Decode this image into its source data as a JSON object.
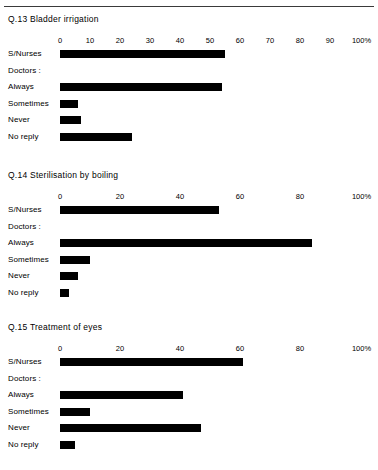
{
  "page": {
    "background": "#ffffff",
    "bar_color": "#000000",
    "rule_color": "#3a3a3a"
  },
  "charts": [
    {
      "title": "Q.13  Bladder irrigation",
      "axis": {
        "ticks": [
          "0",
          "10",
          "20",
          "30",
          "40",
          "50",
          "60",
          "70",
          "80",
          "90",
          "100%"
        ],
        "tick_values": [
          0,
          10,
          20,
          30,
          40,
          50,
          60,
          70,
          80,
          90,
          100
        ]
      },
      "rows": [
        {
          "label": "S/Nurses",
          "value": 55,
          "heading": false
        },
        {
          "label": "Doctors :",
          "value": null,
          "heading": true
        },
        {
          "label": "Always",
          "value": 54,
          "heading": false
        },
        {
          "label": "Sometimes",
          "value": 6,
          "heading": false
        },
        {
          "label": "Never",
          "value": 7,
          "heading": false
        },
        {
          "label": "No reply",
          "value": 24,
          "heading": false
        }
      ]
    },
    {
      "title": "Q.14  Sterilisation by boiling",
      "axis": {
        "ticks": [
          "0",
          "20",
          "40",
          "60",
          "80",
          "100%"
        ],
        "tick_values": [
          0,
          20,
          40,
          60,
          80,
          100
        ]
      },
      "rows": [
        {
          "label": "S/Nurses",
          "value": 53,
          "heading": false
        },
        {
          "label": "Doctors :",
          "value": null,
          "heading": true
        },
        {
          "label": "Always",
          "value": 84,
          "heading": false
        },
        {
          "label": "Sometimes",
          "value": 10,
          "heading": false
        },
        {
          "label": "Never",
          "value": 6,
          "heading": false
        },
        {
          "label": "No reply",
          "value": 3,
          "heading": false
        }
      ]
    },
    {
      "title": "Q.15  Treatment of eyes",
      "axis": {
        "ticks": [
          "0",
          "20",
          "40",
          "60",
          "80",
          "100%"
        ],
        "tick_values": [
          0,
          20,
          40,
          60,
          80,
          100
        ]
      },
      "rows": [
        {
          "label": "S/Nurses",
          "value": 61,
          "heading": false
        },
        {
          "label": "Doctors :",
          "value": null,
          "heading": true
        },
        {
          "label": "Always",
          "value": 41,
          "heading": false
        },
        {
          "label": "Sometimes",
          "value": 10,
          "heading": false
        },
        {
          "label": "Never",
          "value": 47,
          "heading": false
        },
        {
          "label": "No reply",
          "value": 5,
          "heading": false
        }
      ]
    }
  ],
  "chart_data": [
    {
      "type": "bar",
      "orientation": "horizontal",
      "title": "Q.13  Bladder irrigation",
      "categories": [
        "S/Nurses",
        "Always",
        "Sometimes",
        "Never",
        "No reply"
      ],
      "values": [
        55,
        54,
        6,
        7,
        24
      ],
      "group_heading": "Doctors :",
      "xlabel": "100%",
      "ylabel": "",
      "xlim": [
        0,
        100
      ],
      "xticks": [
        0,
        10,
        20,
        30,
        40,
        50,
        60,
        70,
        80,
        90,
        100
      ],
      "grid": false,
      "legend": "none"
    },
    {
      "type": "bar",
      "orientation": "horizontal",
      "title": "Q.14  Sterilisation by boiling",
      "categories": [
        "S/Nurses",
        "Always",
        "Sometimes",
        "Never",
        "No reply"
      ],
      "values": [
        53,
        84,
        10,
        6,
        3
      ],
      "group_heading": "Doctors :",
      "xlabel": "100%",
      "ylabel": "",
      "xlim": [
        0,
        100
      ],
      "xticks": [
        0,
        20,
        40,
        60,
        80,
        100
      ],
      "grid": false,
      "legend": "none"
    },
    {
      "type": "bar",
      "orientation": "horizontal",
      "title": "Q.15  Treatment of eyes",
      "categories": [
        "S/Nurses",
        "Always",
        "Sometimes",
        "Never",
        "No reply"
      ],
      "values": [
        61,
        41,
        10,
        47,
        5
      ],
      "group_heading": "Doctors :",
      "xlabel": "100%",
      "ylabel": "",
      "xlim": [
        0,
        100
      ],
      "xticks": [
        0,
        20,
        40,
        60,
        80,
        100
      ],
      "grid": false,
      "legend": "none"
    }
  ]
}
